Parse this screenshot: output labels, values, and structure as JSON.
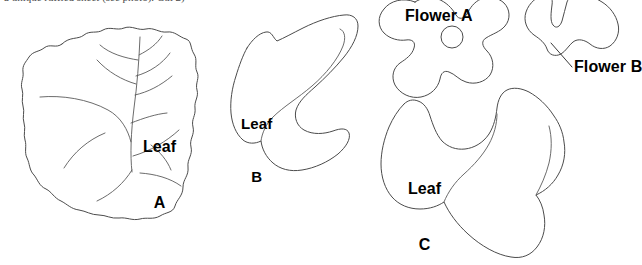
{
  "document": {
    "kind": "craft-pattern-template-sheet",
    "background_color": "#ffffff",
    "outline_color": "#4b4b4b",
    "vein_color": "#5a5a5a",
    "label_color": "#000000",
    "canvas": {
      "width": 642,
      "height": 265
    }
  },
  "top_caption": {
    "text": "a unique ruffled sheet (see photo). Cut 2)",
    "visibility": "clipped at top edge, only descenders visible"
  },
  "pieces": [
    {
      "id": "leaf-a",
      "label_lines": [
        "Leaf",
        "A"
      ],
      "label_text": "Leaf A",
      "shape": "large ruffled wavy-edge leaf with interior vein lines",
      "has_veins": true,
      "has_center_hole": false
    },
    {
      "id": "leaf-b",
      "label_lines": [
        "Leaf",
        "B"
      ],
      "label_text": "Leaf B",
      "shape": "curved crescent leaf with lower lobe",
      "has_veins": false,
      "has_center_hole": false
    },
    {
      "id": "leaf-c",
      "label_lines": [
        "Leaf",
        "C"
      ],
      "label_text": "Leaf C",
      "shape": "large irregular lobed leaf",
      "has_veins": false,
      "has_center_hole": false
    },
    {
      "id": "flower-a",
      "label_lines": [
        "Flower A"
      ],
      "label_text": "Flower A",
      "shape": "five-petal flower with round center hole",
      "has_veins": false,
      "has_center_hole": true
    },
    {
      "id": "flower-b",
      "label_lines": [
        "Flower B"
      ],
      "label_text": "Flower B",
      "shape": "small petal flower piece at top-right",
      "has_veins": false,
      "has_center_hole": false,
      "has_leader_line": true
    }
  ],
  "labels": {
    "leaf_a_line1": "Leaf",
    "leaf_a_line2": "A",
    "leaf_b_line1": "Leaf",
    "leaf_b_line2": "B",
    "leaf_c_line1": "Leaf",
    "leaf_c_line2": "C",
    "flower_a": "Flower A",
    "flower_b": "Flower B"
  }
}
